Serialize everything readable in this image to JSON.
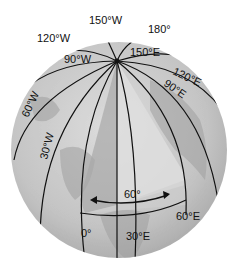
{
  "diagram": {
    "labels": {
      "w150": "150°W",
      "e180": "180°",
      "w120": "120°W",
      "w90": "90°W",
      "e150": "150°E",
      "e120": "120°E",
      "e90": "90°E",
      "w60": "60°W",
      "w30": "30°W",
      "angle": "60°",
      "e60": "60°E",
      "zero": "0°",
      "e30": "30°E"
    },
    "colors": {
      "globe": "#c9c9c9",
      "wedge_light": "#d9d9d9",
      "wedge_dark": "#a8a8a8",
      "lines": "#111111"
    }
  }
}
